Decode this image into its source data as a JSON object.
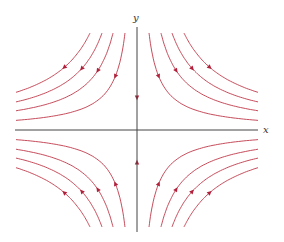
{
  "diagram": {
    "type": "phase-portrait-saddle",
    "axes": {
      "x_label": "x",
      "y_label": "y",
      "axis_color": "#444444"
    },
    "curve_color": "#c0394a",
    "arrow_color": "#b0203a",
    "origin_px": [
      137,
      130
    ],
    "trajectories": {
      "quadrants": [
        "top-left",
        "top-right",
        "bottom-left",
        "bottom-right"
      ],
      "per_quadrant": 4,
      "direction": "toward x-axis, away from origin along x"
    },
    "y_axis_arrows": [
      "down (above origin)",
      "up (below origin)"
    ]
  }
}
